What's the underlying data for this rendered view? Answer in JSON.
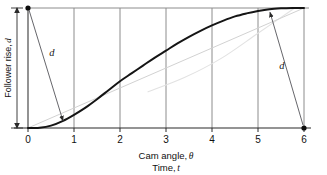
{
  "figure": {
    "kind": "cam-displacement-diagram",
    "background": "#ffffff"
  },
  "chart_data": {
    "type": "line",
    "title": "",
    "xlabel_primary": "Cam angle,",
    "xlabel_primary_symbol": "θ",
    "xlabel_secondary": "Time,",
    "xlabel_secondary_symbol": "t",
    "ylabel": "Follower rise,",
    "ylabel_symbol": "d",
    "xlim": [
      0,
      6
    ],
    "ylim": [
      0,
      1
    ],
    "xticks": [
      0,
      1,
      2,
      3,
      4,
      5,
      6
    ],
    "xtick_labels": [
      "0",
      "1",
      "2",
      "3",
      "4",
      "5",
      "6"
    ],
    "yticks": [],
    "ytick_labels": [],
    "grid": "vertical-only",
    "grid_color": "#8c8c8c",
    "legend": "none",
    "series": [
      {
        "name": "follower-rise-curve",
        "style": "solid-thick",
        "color": "#151515",
        "x": [
          0.0,
          0.25,
          0.5,
          0.75,
          1.0,
          1.25,
          1.5,
          1.75,
          2.0,
          2.25,
          2.5,
          2.75,
          3.0,
          3.25,
          3.5,
          3.75,
          4.0,
          4.25,
          4.5,
          4.75,
          5.0,
          5.25,
          5.5,
          5.75,
          6.0
        ],
        "y": [
          0.0,
          0.003,
          0.02,
          0.058,
          0.11,
          0.17,
          0.24,
          0.315,
          0.39,
          0.455,
          0.52,
          0.585,
          0.645,
          0.705,
          0.76,
          0.81,
          0.855,
          0.895,
          0.93,
          0.955,
          0.975,
          0.99,
          0.997,
          1.0,
          1.0
        ]
      },
      {
        "name": "chord-reference-line",
        "style": "solid-faint",
        "color": "#cfcfcf",
        "x": [
          0.0,
          6.0
        ],
        "y": [
          0.0,
          1.0
        ]
      },
      {
        "name": "faint-background-arc",
        "style": "solid-faint",
        "color": "#dcdcdc",
        "x": [
          2.6,
          3.4,
          4.2,
          5.0,
          5.8
        ],
        "y": [
          0.3,
          0.42,
          0.58,
          0.79,
          1.0
        ]
      }
    ],
    "annotations": [
      {
        "name": "deviation-left",
        "label": "d",
        "from_x": 0.0,
        "from_y": 1.0,
        "to_x": 0.76,
        "to_y": 0.06,
        "label_x": 0.52,
        "label_y": 0.6
      },
      {
        "name": "deviation-right",
        "label": "d",
        "from_x": 6.0,
        "from_y": 0.0,
        "to_x": 5.26,
        "to_y": 0.965,
        "label_x": 5.52,
        "label_y": 0.49
      }
    ],
    "markers": [
      {
        "name": "start-point",
        "x": 0.0,
        "y": 1.0
      },
      {
        "name": "end-point",
        "x": 6.0,
        "y": 0.0
      }
    ],
    "y_extent_arrow": {
      "name": "follower-rise-extent",
      "from_y": 0.0,
      "to_y": 1.0,
      "double_headed": true
    }
  }
}
